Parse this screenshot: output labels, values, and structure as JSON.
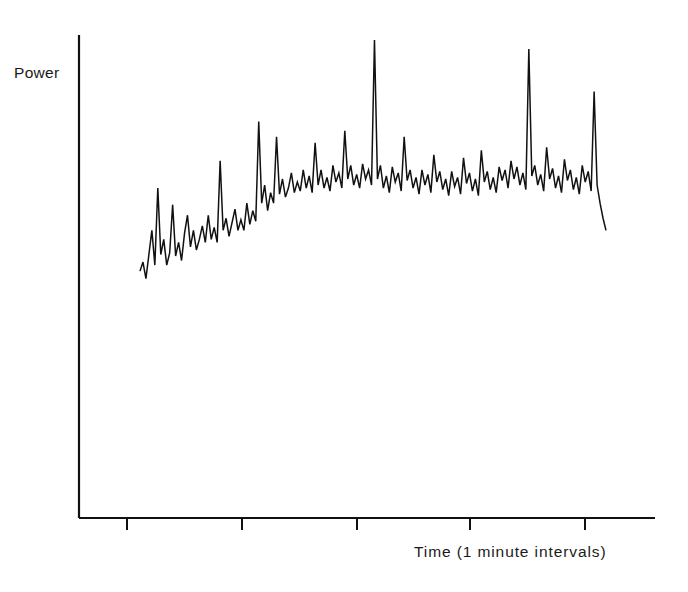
{
  "figure": {
    "width": 688,
    "height": 592,
    "background": "#ffffff",
    "ink_color": "#111111"
  },
  "labels": {
    "ylabel": "Power",
    "xlabel": "Time (1 minute intervals)"
  },
  "chart_data": {
    "type": "line",
    "title": "",
    "subtitle": "",
    "xlabel": "Time (1 minute intervals)",
    "ylabel": "Power",
    "grid": false,
    "legend": null,
    "annotations": [],
    "axes": {
      "y_axis_x_px": 79,
      "y_axis_top_px": 35,
      "x_axis_y_px": 518,
      "x_axis_left_px": 79,
      "x_axis_right_px": 655,
      "tick_positions_px": [
        127,
        242,
        357,
        470,
        585
      ],
      "tick_direction": "down",
      "tick_length_px": 12,
      "tick_labels": [],
      "spines": [
        "left",
        "bottom"
      ]
    },
    "xlim": [
      0,
      190
    ],
    "ylim": [
      0,
      1
    ],
    "x": [
      0,
      1,
      2,
      3,
      4,
      5,
      6,
      7,
      8,
      9,
      10,
      11,
      12,
      13,
      14,
      15,
      16,
      17,
      18,
      19,
      20,
      21,
      22,
      23,
      24,
      25,
      26,
      27,
      28,
      29,
      30,
      31,
      32,
      33,
      34,
      35,
      36,
      37,
      38,
      39,
      40,
      41,
      42,
      43,
      44,
      45,
      46,
      47,
      48,
      49,
      50,
      51,
      52,
      53,
      54,
      55,
      56,
      57,
      58,
      59,
      60,
      61,
      62,
      63,
      64,
      65,
      66,
      67,
      68,
      69,
      70,
      71,
      72,
      73,
      74,
      75,
      76,
      77,
      78,
      79,
      80,
      81,
      82,
      83,
      84,
      85,
      86,
      87,
      88,
      89,
      90,
      91,
      92,
      93,
      94,
      95,
      96,
      97,
      98,
      99,
      100,
      101,
      102,
      103,
      104,
      105,
      106,
      107,
      108,
      109,
      110,
      111,
      112,
      113,
      114,
      115,
      116,
      117,
      118,
      119,
      120,
      121,
      122,
      123,
      124,
      125,
      126,
      127,
      128,
      129,
      130,
      131,
      132,
      133,
      134,
      135,
      136,
      137,
      138,
      139,
      140,
      141,
      142,
      143,
      144,
      145,
      146,
      147,
      148,
      149,
      150,
      151,
      152,
      153,
      154,
      155
    ],
    "y": [
      0.195,
      0.225,
      0.17,
      0.25,
      0.33,
      0.215,
      0.47,
      0.25,
      0.3,
      0.215,
      0.255,
      0.415,
      0.245,
      0.29,
      0.23,
      0.32,
      0.38,
      0.275,
      0.33,
      0.265,
      0.3,
      0.345,
      0.29,
      0.38,
      0.3,
      0.34,
      0.29,
      0.56,
      0.33,
      0.37,
      0.31,
      0.355,
      0.4,
      0.33,
      0.365,
      0.33,
      0.42,
      0.35,
      0.395,
      0.36,
      0.69,
      0.42,
      0.48,
      0.395,
      0.455,
      0.42,
      0.64,
      0.45,
      0.5,
      0.44,
      0.47,
      0.52,
      0.455,
      0.49,
      0.46,
      0.53,
      0.47,
      0.51,
      0.455,
      0.62,
      0.48,
      0.53,
      0.47,
      0.505,
      0.46,
      0.545,
      0.49,
      0.52,
      0.47,
      0.66,
      0.5,
      0.545,
      0.48,
      0.515,
      0.47,
      0.55,
      0.5,
      0.53,
      0.48,
      0.96,
      0.5,
      0.545,
      0.47,
      0.51,
      0.455,
      0.54,
      0.49,
      0.52,
      0.46,
      0.64,
      0.495,
      0.53,
      0.47,
      0.505,
      0.45,
      0.53,
      0.48,
      0.515,
      0.455,
      0.58,
      0.49,
      0.525,
      0.465,
      0.5,
      0.445,
      0.525,
      0.475,
      0.505,
      0.45,
      0.57,
      0.485,
      0.52,
      0.46,
      0.5,
      0.445,
      0.595,
      0.49,
      0.525,
      0.465,
      0.505,
      0.455,
      0.54,
      0.495,
      0.53,
      0.47,
      0.56,
      0.5,
      0.54,
      0.48,
      0.52,
      0.465,
      0.93,
      0.51,
      0.545,
      0.48,
      0.515,
      0.46,
      0.605,
      0.5,
      0.535,
      0.47,
      0.51,
      0.455,
      0.565,
      0.495,
      0.53,
      0.465,
      0.505,
      0.45,
      0.545,
      0.49,
      0.525,
      0.46,
      0.79,
      0.48,
      0.42,
      0.37,
      0.33
    ]
  }
}
